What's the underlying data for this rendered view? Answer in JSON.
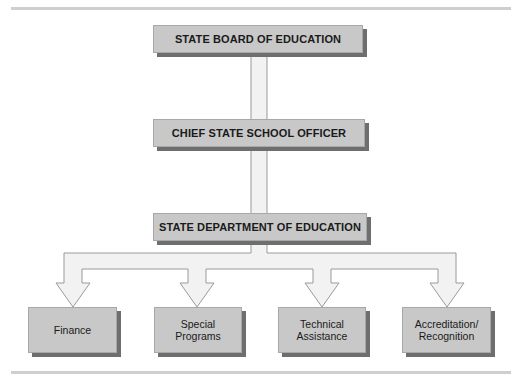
{
  "diagram": {
    "type": "organizational-chart",
    "levels": [
      {
        "id": "board",
        "label": "STATE BOARD OF EDUCATION"
      },
      {
        "id": "chief",
        "label": "CHIEF STATE SCHOOL OFFICER"
      },
      {
        "id": "department",
        "label": "STATE DEPARTMENT OF EDUCATION"
      }
    ],
    "divisions": [
      {
        "id": "finance",
        "label": "Finance"
      },
      {
        "id": "special-programs",
        "label": "Special\nPrograms"
      },
      {
        "id": "technical-assistance",
        "label": "Technical\nAssistance"
      },
      {
        "id": "accreditation",
        "label": "Accreditation/\nRecognition"
      }
    ],
    "edges": [
      [
        "board",
        "chief"
      ],
      [
        "chief",
        "department"
      ],
      [
        "department",
        "finance"
      ],
      [
        "department",
        "special-programs"
      ],
      [
        "department",
        "technical-assistance"
      ],
      [
        "department",
        "accreditation"
      ]
    ],
    "colors": {
      "box_fill": "#c8c8c8",
      "box_shadow": "#6e6e6e",
      "connector_fill": "#f2f2f2",
      "connector_stroke": "#9a9a9a",
      "rule": "#cfcfcf"
    }
  }
}
